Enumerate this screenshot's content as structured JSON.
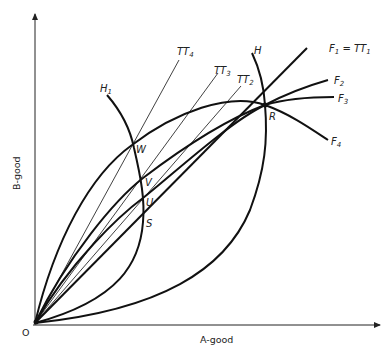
{
  "diagram": {
    "axes": {
      "x_label": "A-good",
      "y_label": "B-good",
      "origin_label": "O"
    },
    "points": {
      "R": "R",
      "W": "W",
      "V": "V",
      "U": "U",
      "S": "S"
    },
    "curves": {
      "H": {
        "name": "H",
        "sub": ""
      },
      "H1": {
        "name": "H",
        "sub": "1"
      },
      "F1": {
        "name": "F",
        "sub": "1",
        "eq": " = TT",
        "eq_sub": "1"
      },
      "F2": {
        "name": "F",
        "sub": "2"
      },
      "F3": {
        "name": "F",
        "sub": "3"
      },
      "F4": {
        "name": "F",
        "sub": "4"
      },
      "TT2": {
        "name": "TT",
        "sub": "2"
      },
      "TT3": {
        "name": "TT",
        "sub": "3"
      },
      "TT4": {
        "name": "TT",
        "sub": "4"
      }
    }
  }
}
